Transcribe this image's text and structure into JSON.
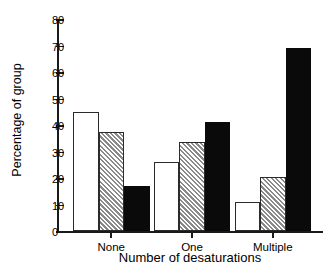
{
  "chart_data": {
    "type": "bar",
    "title": "",
    "xlabel": "Number of desaturations",
    "ylabel": "Percentage of group",
    "categories": [
      "None",
      "One",
      "Multiple"
    ],
    "ylim": [
      0,
      80
    ],
    "yticks": [
      0,
      10,
      20,
      30,
      40,
      50,
      60,
      70,
      80
    ],
    "ytick_labels": [
      "0",
      "10",
      "20",
      "30",
      "40",
      "50",
      "60",
      "70",
      "80"
    ],
    "grid": false,
    "legend": "none",
    "series": [
      {
        "name": "white",
        "fill": "white",
        "values": [
          45,
          26,
          11
        ]
      },
      {
        "name": "hatched",
        "fill": "diagonal-hatch",
        "values": [
          37.5,
          33.5,
          20.5
        ]
      },
      {
        "name": "black",
        "fill": "black",
        "values": [
          17,
          41,
          69
        ]
      }
    ]
  },
  "colors": {
    "axis": "#1a1a1a",
    "bar_outline": "#2b2b2b",
    "bar_black": "#0a0a0a",
    "bar_white": "#ffffff",
    "bar_hatch_bg": "#d9d9d9",
    "background": "#ffffff"
  }
}
